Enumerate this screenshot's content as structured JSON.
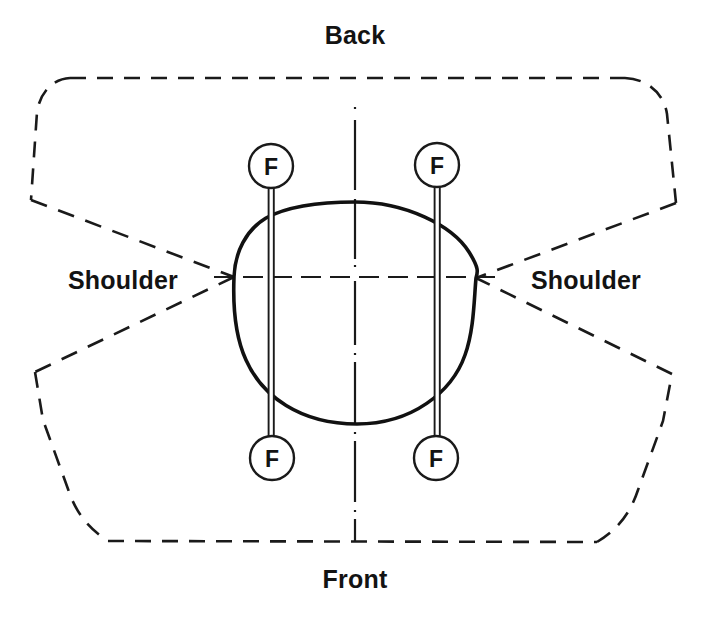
{
  "diagram": {
    "title_back": "Back",
    "title_front": "Front",
    "shoulder_left": "Shoulder",
    "shoulder_right": "Shoulder",
    "marker_label": "F",
    "markers": [
      {
        "id": "marker-top-left",
        "label": "F",
        "cx": 271,
        "cy": 166,
        "r": 22
      },
      {
        "id": "marker-top-right",
        "label": "F",
        "cx": 437,
        "cy": 165,
        "r": 22
      },
      {
        "id": "marker-bottom-left",
        "label": "F",
        "cx": 272,
        "cy": 458,
        "r": 22
      },
      {
        "id": "marker-bottom-right",
        "label": "F",
        "cx": 436,
        "cy": 458,
        "r": 22
      }
    ],
    "colors": {
      "stroke": "#1a1a1a",
      "head_stroke": "#111111",
      "text": "#131313",
      "background": "#ffffff"
    },
    "geometry": {
      "head_top_y": 202,
      "head_bottom_y": 424,
      "head_left_x": 234,
      "head_right_x": 478,
      "center_x": 355,
      "center_y": 277,
      "shoulder_left_point": [
        234,
        277
      ],
      "shoulder_right_point": [
        476,
        278
      ],
      "stem_left_x": 271,
      "stem_right_x": 437,
      "bottom_edge_y": 542,
      "top_edge_y": 78
    },
    "labels": {
      "back": {
        "x": 355,
        "y": 44,
        "anchor": "middle"
      },
      "front": {
        "x": 355,
        "y": 588,
        "anchor": "middle"
      },
      "shoulder_left": {
        "x": 68,
        "y": 289,
        "anchor": "start"
      },
      "shoulder_right": {
        "x": 531,
        "y": 289,
        "anchor": "start"
      }
    }
  }
}
